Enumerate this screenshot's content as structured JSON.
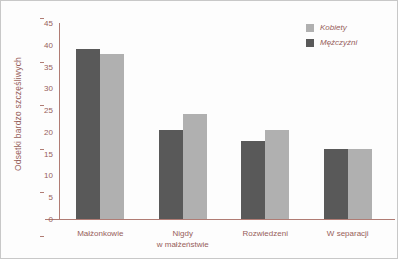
{
  "chart_data": {
    "type": "bar",
    "title": "",
    "xlabel": "",
    "ylabel": "Odsetki bardzo szczęśliwych",
    "ylim": [
      0,
      45
    ],
    "yticks": [
      0,
      5,
      10,
      15,
      20,
      25,
      30,
      35,
      40,
      45
    ],
    "grid": false,
    "legend_position": "top-right",
    "categories": [
      "Małżonkowie",
      "Nigdy\nw małżeństwie",
      "Rozwiedzeni",
      "W separacji"
    ],
    "category_lines": [
      [
        "Małżonkowie"
      ],
      [
        "Nigdy",
        "w małżeństwie"
      ],
      [
        "Rozwiedzeni"
      ],
      [
        "W separacji"
      ]
    ],
    "series": [
      {
        "name": "Mężczyźni",
        "color": "#595959",
        "values": [
          39,
          20.5,
          18,
          16
        ]
      },
      {
        "name": "Kobiety",
        "color": "#b0b0b0",
        "values": [
          38,
          24,
          20.5,
          16
        ]
      }
    ],
    "legend_order": [
      "Kobiety",
      "Mężczyźni"
    ],
    "bar_order_in_group": [
      "Mężczyźni",
      "Kobiety"
    ]
  },
  "legend": {
    "items": [
      {
        "label": "Kobiety",
        "swatch": "light"
      },
      {
        "label": "Mężczyźni",
        "swatch": "dark"
      }
    ]
  },
  "colors": {
    "dark_bar": "#595959",
    "light_bar": "#b0b0b0",
    "axis": "#b07c74",
    "text": "#97605a",
    "background": "#fdfdfd"
  }
}
